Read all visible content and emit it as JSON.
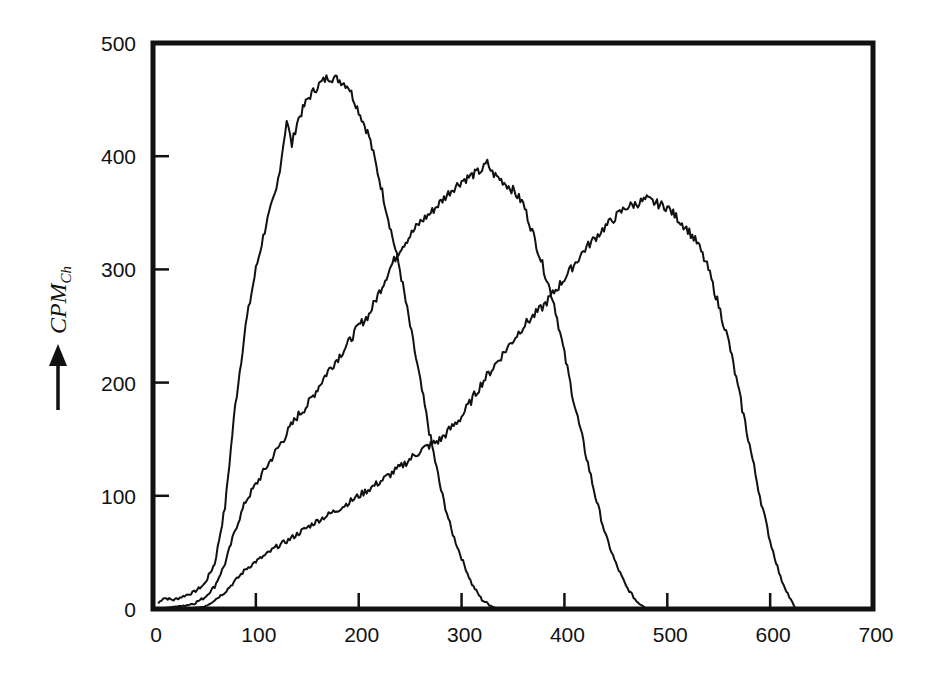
{
  "chart_data": {
    "type": "line",
    "title": "",
    "xlabel": "",
    "ylabel": "CPM",
    "ylabel_subscript": "Ch",
    "ylabel_arrow": "up-arrow",
    "xlim": [
      0,
      700
    ],
    "ylim": [
      0,
      500
    ],
    "grid": false,
    "legend": null,
    "x_ticks": [
      0,
      100,
      200,
      300,
      400,
      500,
      600,
      700
    ],
    "y_ticks": [
      0,
      100,
      200,
      300,
      400,
      500
    ],
    "x_tick_labels": [
      "0",
      "100",
      "200",
      "300",
      "400",
      "500",
      "600",
      "700"
    ],
    "y_tick_labels": [
      "0",
      "100",
      "200",
      "300",
      "400",
      "500"
    ],
    "series": [
      {
        "name": "curve-1",
        "x": [
          5,
          10,
          20,
          40,
          50,
          60,
          70,
          80,
          90,
          100,
          110,
          120,
          125,
          130,
          135,
          140,
          150,
          160,
          170,
          180,
          190,
          200,
          210,
          220,
          230,
          240,
          250,
          260,
          270,
          280,
          290,
          300,
          310,
          320,
          330,
          335
        ],
        "y": [
          5,
          10,
          8,
          15,
          22,
          40,
          90,
          180,
          250,
          300,
          340,
          370,
          400,
          432,
          410,
          430,
          450,
          462,
          470,
          468,
          462,
          440,
          418,
          380,
          340,
          300,
          250,
          200,
          150,
          105,
          70,
          45,
          22,
          8,
          2,
          0
        ]
      },
      {
        "name": "curve-2",
        "x": [
          5,
          20,
          30,
          40,
          50,
          60,
          70,
          80,
          90,
          100,
          110,
          120,
          130,
          140,
          150,
          160,
          170,
          180,
          190,
          200,
          210,
          220,
          230,
          240,
          250,
          260,
          270,
          280,
          290,
          300,
          310,
          320,
          325,
          330,
          340,
          350,
          360,
          370,
          380,
          390,
          400,
          410,
          420,
          430,
          440,
          450,
          460,
          470,
          480
        ],
        "y": [
          0,
          2,
          3,
          5,
          10,
          20,
          40,
          70,
          95,
          110,
          125,
          140,
          155,
          170,
          180,
          195,
          210,
          222,
          235,
          250,
          260,
          280,
          300,
          318,
          330,
          342,
          350,
          360,
          370,
          378,
          383,
          388,
          394,
          385,
          378,
          370,
          358,
          330,
          300,
          270,
          225,
          180,
          140,
          100,
          65,
          40,
          20,
          7,
          0
        ]
      },
      {
        "name": "curve-3",
        "x": [
          5,
          30,
          50,
          60,
          70,
          80,
          90,
          100,
          110,
          120,
          130,
          140,
          150,
          160,
          180,
          200,
          220,
          240,
          260,
          270,
          280,
          300,
          320,
          340,
          360,
          380,
          390,
          400,
          420,
          440,
          460,
          470,
          480,
          490,
          500,
          510,
          520,
          530,
          540,
          550,
          560,
          570,
          580,
          590,
          600,
          610,
          620,
          625
        ],
        "y": [
          0,
          0,
          2,
          8,
          15,
          25,
          35,
          42,
          48,
          55,
          60,
          66,
          72,
          78,
          88,
          100,
          112,
          125,
          140,
          145,
          150,
          170,
          200,
          225,
          250,
          268,
          280,
          292,
          318,
          338,
          355,
          358,
          362,
          358,
          355,
          345,
          335,
          322,
          300,
          268,
          235,
          190,
          145,
          100,
          60,
          28,
          8,
          0
        ]
      }
    ]
  }
}
